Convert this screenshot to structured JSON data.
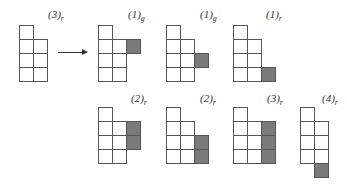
{
  "cell_size": 14,
  "initial": {
    "label": "(3)",
    "sub": "r",
    "x": 19,
    "y": 25,
    "columns": [
      4,
      3
    ],
    "column_offsets": [
      0,
      1
    ],
    "shaded": []
  },
  "arrow": {
    "direction": "right"
  },
  "results": [
    {
      "label": "(1)",
      "sub": "g",
      "x": 98,
      "y": 25,
      "columns": [
        4,
        3,
        1
      ],
      "column_offsets": [
        0,
        1,
        1
      ],
      "shaded": [
        [
          2,
          1
        ]
      ]
    },
    {
      "label": "(1)",
      "sub": "g",
      "x": 166,
      "y": 25,
      "columns": [
        4,
        3,
        1
      ],
      "column_offsets": [
        0,
        1,
        2
      ],
      "shaded": [
        [
          2,
          2
        ]
      ]
    },
    {
      "label": "(1)",
      "sub": "r",
      "x": 233,
      "y": 25,
      "columns": [
        4,
        3,
        1
      ],
      "column_offsets": [
        0,
        1,
        3
      ],
      "shaded": [
        [
          2,
          3
        ]
      ]
    },
    {
      "label": "(2)",
      "sub": "r",
      "x": 98,
      "y": 107,
      "columns": [
        4,
        3,
        2
      ],
      "column_offsets": [
        0,
        1,
        1
      ],
      "shaded": [
        [
          2,
          1
        ],
        [
          2,
          2
        ]
      ]
    },
    {
      "label": "(2)",
      "sub": "r",
      "x": 166,
      "y": 107,
      "columns": [
        4,
        3,
        2
      ],
      "column_offsets": [
        0,
        1,
        2
      ],
      "shaded": [
        [
          2,
          2
        ],
        [
          2,
          3
        ]
      ]
    },
    {
      "label": "(3)",
      "sub": "r",
      "x": 233,
      "y": 107,
      "columns": [
        4,
        3,
        3
      ],
      "column_offsets": [
        0,
        1,
        1
      ],
      "shaded": [
        [
          2,
          1
        ],
        [
          2,
          2
        ],
        [
          2,
          3
        ]
      ]
    },
    {
      "label": "(4)",
      "sub": "r",
      "x": 300,
      "y": 107,
      "columns": [
        4,
        4
      ],
      "column_offsets": [
        0,
        1
      ],
      "shaded": [
        [
          1,
          4
        ]
      ]
    }
  ],
  "label_positions": [
    {
      "x": 48,
      "y": 8
    },
    {
      "x": 128,
      "y": 8
    },
    {
      "x": 200,
      "y": 8
    },
    {
      "x": 266,
      "y": 8
    },
    {
      "x": 131,
      "y": 92
    },
    {
      "x": 200,
      "y": 92
    },
    {
      "x": 267,
      "y": 92
    },
    {
      "x": 322,
      "y": 92
    }
  ]
}
